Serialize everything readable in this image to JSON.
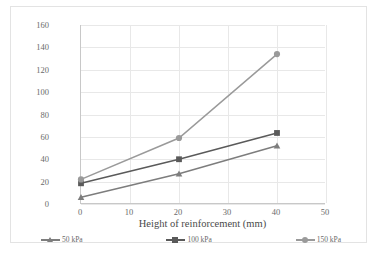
{
  "chart_data": {
    "type": "line",
    "title": "",
    "xlabel": "Height of reinforcement (mm)",
    "ylabel": "Peak deviator stress at  20% strain\n(kPa)",
    "xlim": [
      0,
      50
    ],
    "ylim": [
      0,
      160
    ],
    "xticks": [
      "0",
      "10",
      "20",
      "30",
      "40",
      "50"
    ],
    "yticks": [
      "0",
      "20",
      "40",
      "60",
      "80",
      "100",
      "120",
      "140",
      "160"
    ],
    "xtick_values": [
      0,
      10,
      20,
      30,
      40,
      50
    ],
    "ytick_values": [
      0,
      20,
      40,
      60,
      80,
      100,
      120,
      140,
      160
    ],
    "grid": "horizontal-and-vertical",
    "legend_position": "bottom",
    "x": [
      0,
      20,
      40
    ],
    "series": [
      {
        "name": "50 kPa",
        "marker": "triangle",
        "color": "#7d7d7d",
        "values": [
          6,
          27,
          52
        ]
      },
      {
        "name": "100 kPa",
        "marker": "square",
        "color": "#5a5a5a",
        "values": [
          18.5,
          40,
          63.5
        ]
      },
      {
        "name": "150 kPa",
        "marker": "circle",
        "color": "#9a9a9a",
        "values": [
          22,
          59,
          134
        ]
      }
    ]
  },
  "legend": {
    "items": [
      {
        "label": "50 kPa"
      },
      {
        "label": "100 kPa"
      },
      {
        "label": "150 kPa"
      }
    ]
  },
  "axes": {
    "x_title": "Height of reinforcement (mm)",
    "y_title_line1": "Peak deviator stress at  20% strain",
    "y_title_line2": "(kPa)"
  },
  "colors": {
    "frame_border": "#e3e3e3",
    "gridline": "#e8e8e8",
    "axis_line": "#c8c8c8",
    "tick_text": "#6a6a6a",
    "title_text": "#4a4a4a",
    "series_50": "#7d7d7d",
    "series_100": "#5a5a5a",
    "series_150": "#9a9a9a",
    "background": "#ffffff"
  }
}
